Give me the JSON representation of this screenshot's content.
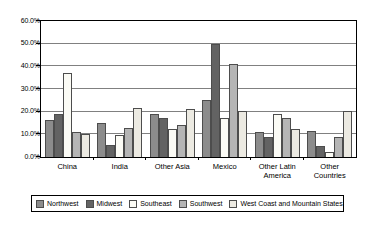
{
  "chart_data": {
    "type": "bar",
    "title": "",
    "subtitle": "",
    "xlabel": "",
    "ylabel": "",
    "ylim": [
      0,
      60
    ],
    "ytick_labels": [
      "60.0%",
      "50.0%",
      "40.0%",
      "30.0%",
      "20.0%",
      "10.0%",
      "0.0%"
    ],
    "ytick_values": [
      60,
      50,
      40,
      30,
      20,
      10,
      0
    ],
    "grid": true,
    "legend_position": "bottom",
    "categories": [
      "China",
      "India",
      "Other Asia",
      "Mexico",
      "Other Latin America",
      "Other Countries"
    ],
    "series": [
      {
        "name": "Northwest",
        "color": "#8c8c8c",
        "values": [
          16.5,
          15.0,
          19.0,
          25.0,
          11.0,
          11.5
        ]
      },
      {
        "name": "Midwest",
        "color": "#636363",
        "values": [
          19.0,
          5.5,
          17.0,
          50.0,
          9.0,
          5.0
        ]
      },
      {
        "name": "Southeast",
        "color": "#fbfbf5",
        "values": [
          37.0,
          9.5,
          12.5,
          17.0,
          19.0,
          2.0
        ]
      },
      {
        "name": "Southwest",
        "color": "#b5b5b5",
        "values": [
          11.0,
          13.0,
          14.0,
          41.0,
          17.0,
          9.0
        ]
      },
      {
        "name": "West Coast and Mountain States",
        "color": "#eceae2",
        "values": [
          10.0,
          21.5,
          21.0,
          20.5,
          12.5,
          20.5
        ]
      }
    ]
  },
  "legend": {
    "items": [
      {
        "label": "Northwest"
      },
      {
        "label": "Midwest"
      },
      {
        "label": "Southeast"
      },
      {
        "label": "Southwest"
      },
      {
        "label": "West Coast and Mountain States"
      }
    ]
  }
}
